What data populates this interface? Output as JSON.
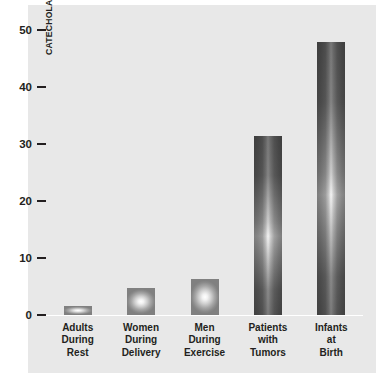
{
  "chart_data": {
    "type": "bar",
    "title": "",
    "subtitle": "",
    "xlabel": "",
    "ylabel": "CATECHOLAMINE LEVELS (NANOMOLES PER LITER)",
    "categories": [
      "Adults During Rest",
      "Women During Delivery",
      "Men During Exercise",
      "Patients with Tumors",
      "Infants at Birth"
    ],
    "category_lines": [
      [
        "Adults",
        "During",
        "Rest"
      ],
      [
        "Women",
        "During",
        "Delivery"
      ],
      [
        "Men",
        "During",
        "Exercise"
      ],
      [
        "Patients",
        "with",
        "Tumors"
      ],
      [
        "Infants",
        "at",
        "Birth"
      ]
    ],
    "values": [
      1.5,
      4.6,
      6.1,
      30.7,
      46.8
    ],
    "ylim": [
      0,
      52
    ],
    "yticks": [
      0,
      10,
      20,
      30,
      40,
      50
    ],
    "ytick_labels": [
      "0",
      "10",
      "20",
      "30",
      "40",
      "50"
    ],
    "grid": false,
    "legend": null,
    "colors": {
      "panel_background": "#e8e8e8",
      "page_background": "#ffffff",
      "bar_edge": "#808080",
      "bar_highlight": "#ffffff",
      "text": "#231f20",
      "axis_line": "#ffffff"
    }
  }
}
